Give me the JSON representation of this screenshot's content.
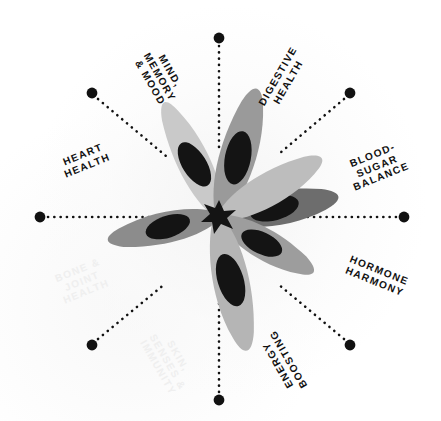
{
  "diagram": {
    "center_icon": "star-anise-icon",
    "background_color": "#ffffff",
    "dot_color": "#111111",
    "label_color": "#111111",
    "faded_label_color": "#efefef",
    "spokes": [
      {
        "id": "mind-memory-mood",
        "label": "MIND,\nMEMORY\n& MOOD",
        "angle_deg": 240,
        "rotation_deg": 60,
        "faded": false,
        "dot": {
          "x": 92,
          "y": 93
        },
        "label_pos": {
          "x": 160,
          "y": 77
        }
      },
      {
        "id": "digestive-health",
        "label": "DIGESTIVE\nHEALTH",
        "angle_deg": 300,
        "rotation_deg": -60,
        "faded": false,
        "dot": {
          "x": 350,
          "y": 93
        },
        "label_pos": {
          "x": 283,
          "y": 79
        }
      },
      {
        "id": "blood-sugar-balance",
        "label": "BLOOD-\nSUGAR\nBALANCE",
        "angle_deg": 0,
        "rotation_deg": -22,
        "faded": false,
        "dot": {
          "x": 404,
          "y": 217
        },
        "label_pos": {
          "x": 377,
          "y": 166
        }
      },
      {
        "id": "hormone-harmony",
        "label": "HORMONE\nHARMONY",
        "angle_deg": 60,
        "rotation_deg": 22,
        "faded": false,
        "dot": {
          "x": 350,
          "y": 345
        },
        "label_pos": {
          "x": 377,
          "y": 276
        }
      },
      {
        "id": "energy-boosting",
        "label": "ENERGY\nBOOSTING",
        "angle_deg": 120,
        "rotation_deg": 240,
        "faded": false,
        "dot": {
          "x": 219,
          "y": 400
        },
        "label_pos": {
          "x": 283,
          "y": 362
        }
      },
      {
        "id": "skin-senses-immunity",
        "label": "SKIN,\nSENSES &\nIMMUNITY",
        "angle_deg": 90,
        "rotation_deg": 60,
        "faded": true,
        "dot": {
          "x": 219,
          "y": 400
        },
        "label_pos": {
          "x": 168,
          "y": 362
        }
      },
      {
        "id": "bone-joint-health",
        "label": "BONE &\nJOINT\nHEALTH",
        "angle_deg": 180,
        "rotation_deg": -22,
        "faded": true,
        "dot": {
          "x": 92,
          "y": 345
        },
        "label_pos": {
          "x": 82,
          "y": 281
        }
      },
      {
        "id": "heart-health",
        "label": "HEART\nHEALTH",
        "angle_deg": 180,
        "rotation_deg": -22,
        "faded": false,
        "dot": {
          "x": 40,
          "y": 217
        },
        "label_pos": {
          "x": 85,
          "y": 160
        }
      }
    ],
    "dot_markers": [
      {
        "id": "dot-top",
        "x": 219,
        "y": 38
      },
      {
        "id": "dot-top-left",
        "x": 92,
        "y": 93
      },
      {
        "id": "dot-top-right",
        "x": 350,
        "y": 93
      },
      {
        "id": "dot-left",
        "x": 40,
        "y": 217
      },
      {
        "id": "dot-right",
        "x": 404,
        "y": 217
      },
      {
        "id": "dot-bottom-left",
        "x": 92,
        "y": 345
      },
      {
        "id": "dot-bottom-right",
        "x": 350,
        "y": 345
      },
      {
        "id": "dot-bottom",
        "x": 219,
        "y": 400
      }
    ],
    "petal_colors": {
      "light": "#c9c9c9",
      "light2": "#bdbdbd",
      "mid": "#9a9a9a",
      "mid2": "#8c8c8c",
      "dark": "#717171",
      "dark2": "#636363",
      "seed": "#141414",
      "core": "#141414"
    }
  }
}
